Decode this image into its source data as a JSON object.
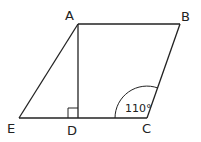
{
  "diagram": {
    "type": "geometry",
    "shape": "parallelogram with perpendicular",
    "line_color": "#222222",
    "background": "#ffffff",
    "points": {
      "A": {
        "label": "A",
        "x": 78,
        "y": 24
      },
      "B": {
        "label": "B",
        "x": 180,
        "y": 24
      },
      "C": {
        "label": "C",
        "x": 147,
        "y": 118
      },
      "D": {
        "label": "D",
        "x": 78,
        "y": 118
      },
      "E": {
        "label": "E",
        "x": 19,
        "y": 118
      }
    },
    "segments": [
      "AB",
      "BC",
      "CE",
      "EA",
      "AD"
    ],
    "right_angle_marker": {
      "at": "D",
      "size": 10
    },
    "angle_marker": {
      "at": "C",
      "value": "110°",
      "radius": 32
    }
  }
}
